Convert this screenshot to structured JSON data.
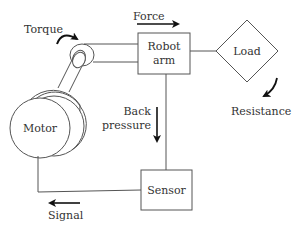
{
  "diagram": {
    "blocks": {
      "motor": "Motor",
      "robot_arm_line1": "Robot",
      "robot_arm_line2": "arm",
      "load": "Load",
      "sensor": "Sensor"
    },
    "labels": {
      "torque": "Torque",
      "force": "Force",
      "resistance": "Resistance",
      "back_pressure_line1": "Back",
      "back_pressure_line2": "pressure",
      "signal": "Signal"
    },
    "colors": {
      "stroke": "#555555",
      "text": "#333333",
      "arrow": "#111111"
    }
  }
}
